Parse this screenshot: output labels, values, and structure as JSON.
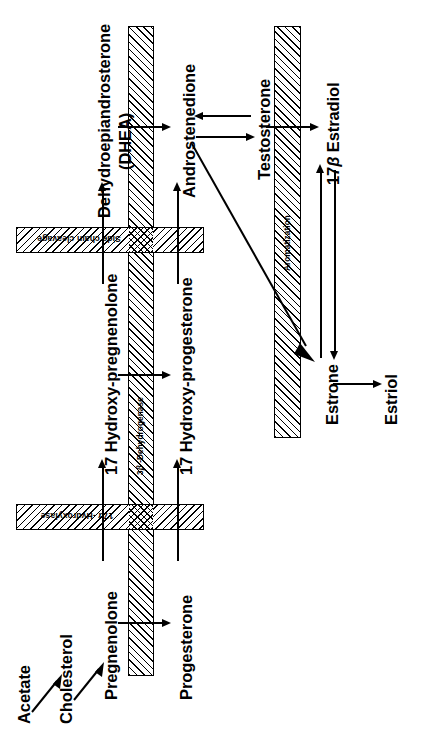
{
  "figure": {
    "orientation": "rotated-90-ccw",
    "ink_color": "#000000",
    "background_color": "#ffffff"
  },
  "compounds": {
    "acetate": "Acetate",
    "cholesterol": "Cholesterol",
    "pregnenolone": "Pregnenolone",
    "progesterone": "Progesterone",
    "hydroxy_pregnenolone": "17 Hydroxy-pregnenolone",
    "hydroxy_progesterone": "17 Hydroxy-progesterone",
    "dhea_line1": "Dehydroepiandrosterone",
    "dhea_line2": "(DHEA)",
    "androstenedione": "Androstenedione",
    "testosterone": "Testosterone",
    "estradiol": "17β Estradiol",
    "estrone": "Estrone",
    "estriol": "Estriol"
  },
  "enzymes": {
    "side_chain_cleavage": "Side chain cleavage",
    "hydroxylase_17a": "17α -Hydroxylase",
    "dehydrogenase_3b": "3β -Dehydrogenase",
    "aromatization": "Aromatization"
  },
  "reactions": [
    {
      "id": "acetate-cholesterol",
      "from": "Acetate",
      "to": "Cholesterol",
      "type": "single"
    },
    {
      "id": "cholesterol-pregnenolone",
      "from": "Cholesterol",
      "to": "Pregnenolone",
      "type": "single"
    },
    {
      "id": "pregnenolone-progesterone",
      "from": "Pregnenolone",
      "to": "Progesterone",
      "enzyme": "3β -Dehydrogenase",
      "type": "single"
    },
    {
      "id": "pregnenolone-17ohpregnenolone",
      "from": "Pregnenolone",
      "to": "17 Hydroxy-pregnenolone",
      "enzyme": "17α -Hydroxylase",
      "type": "single"
    },
    {
      "id": "progesterone-17ohprogesterone",
      "from": "Progesterone",
      "to": "17 Hydroxy-progesterone",
      "enzyme": "17α -Hydroxylase",
      "type": "single"
    },
    {
      "id": "17ohpregnenolone-17ohprogesterone",
      "from": "17 Hydroxy-pregnenolone",
      "to": "17 Hydroxy-progesterone",
      "enzyme": "3β -Dehydrogenase",
      "type": "single"
    },
    {
      "id": "17ohpregnenolone-dhea",
      "from": "17 Hydroxy-pregnenolone",
      "to": "Dehydroepiandrosterone (DHEA)",
      "enzyme": "Side chain cleavage",
      "type": "single"
    },
    {
      "id": "17ohprogesterone-androstenedione",
      "from": "17 Hydroxy-progesterone",
      "to": "Androstenedione",
      "enzyme": "Side chain cleavage",
      "type": "single"
    },
    {
      "id": "dhea-androstenedione",
      "from": "Dehydroepiandrosterone (DHEA)",
      "to": "Androstenedione",
      "enzyme": "3β -Dehydrogenase",
      "type": "single"
    },
    {
      "id": "androstenedione-testosterone",
      "from": "Androstenedione",
      "to": "Testosterone",
      "type": "reversible"
    },
    {
      "id": "testosterone-estradiol",
      "from": "Testosterone",
      "to": "17β Estradiol",
      "enzyme": "Aromatization",
      "type": "single"
    },
    {
      "id": "androstenedione-estrone",
      "from": "Androstenedione",
      "to": "Estrone",
      "enzyme": "Aromatization",
      "type": "single"
    },
    {
      "id": "estradiol-estrone",
      "from": "17β Estradiol",
      "to": "Estrone",
      "type": "reversible"
    },
    {
      "id": "estrone-estriol",
      "from": "Estrone",
      "to": "Estriol",
      "type": "single"
    }
  ]
}
